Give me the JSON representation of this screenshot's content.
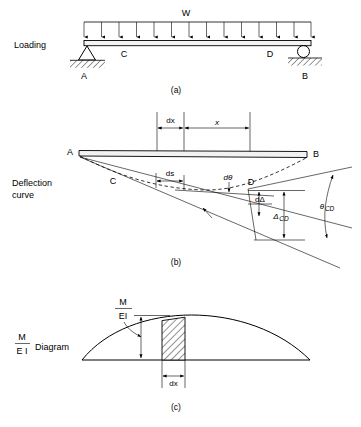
{
  "figure": {
    "panels": [
      {
        "id": "a",
        "caption": "(a)",
        "side_label": "Loading",
        "load_label": "W",
        "points": [
          "A",
          "C",
          "D",
          "B"
        ],
        "support_left": "pin-support",
        "support_right": "roller-support",
        "load_arrow_count": 14
      },
      {
        "id": "b",
        "caption": "(b)",
        "side_label_line1": "Deflection",
        "side_label_line2": "curve",
        "points": [
          "A",
          "B",
          "C",
          "D"
        ],
        "dimensions": {
          "dx": "dx",
          "x": "x",
          "ds": "ds",
          "dtheta": "dθ",
          "ddelta": "dΔ",
          "delta_cd_main": "Δ",
          "delta_cd_sub": "CD",
          "theta_cd_main": "θ",
          "theta_cd_sub": "CD"
        }
      },
      {
        "id": "c",
        "caption": "(c)",
        "side_label_numerator": "M",
        "side_label_denominator": "E I",
        "side_label_word": "Diagram",
        "curve_label_numerator": "M",
        "curve_label_denominator": "EI",
        "strip_width_label": "dx"
      }
    ],
    "colors": {
      "ink": "#000000",
      "paper": "#ffffff",
      "beam_fill": "#f2f2f2"
    }
  }
}
